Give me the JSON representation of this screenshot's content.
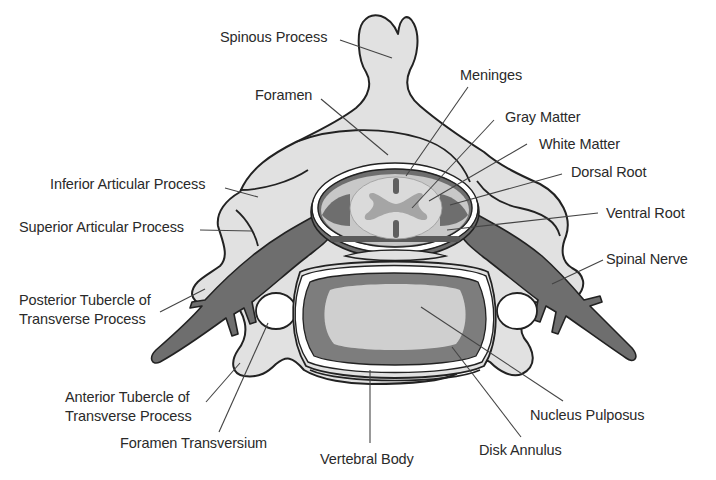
{
  "diagram": {
    "colors": {
      "background": "#ffffff",
      "bone": "#e1e1e1",
      "outline": "#222222",
      "nerve": "#6e6e6e",
      "annulus": "#7d7d7d",
      "nucleus": "#cfcfcf",
      "cord_white": "#dadada",
      "cord_gray": "#a5a5a5",
      "meninges": "#ffffff",
      "leader": "#444444"
    },
    "labels": [
      {
        "id": "spinous-process",
        "text": "Spinous Process",
        "x": 220,
        "y": 28
      },
      {
        "id": "foramen",
        "text": "Foramen",
        "x": 255,
        "y": 86
      },
      {
        "id": "meninges",
        "text": "Meninges",
        "x": 460,
        "y": 66
      },
      {
        "id": "gray-matter",
        "text": "Gray Matter",
        "x": 505,
        "y": 108
      },
      {
        "id": "white-matter",
        "text": "White Matter",
        "x": 539,
        "y": 135
      },
      {
        "id": "dorsal-root",
        "text": "Dorsal Root",
        "x": 571,
        "y": 163
      },
      {
        "id": "ventral-root",
        "text": "Ventral Root",
        "x": 606,
        "y": 204
      },
      {
        "id": "inferior-articular-process",
        "text": "Inferior Articular Process",
        "x": 50,
        "y": 175
      },
      {
        "id": "superior-articular-process",
        "text": "Superior Articular Process",
        "x": 19,
        "y": 218
      },
      {
        "id": "spinal-nerve",
        "text": "Spinal Nerve",
        "x": 606,
        "y": 250
      },
      {
        "id": "posterior-tubercle",
        "text": "Posterior Tubercle of",
        "text2": "Transverse Process",
        "x": 19,
        "y": 291
      },
      {
        "id": "anterior-tubercle",
        "text": "Anterior Tubercle of",
        "text2": "Transverse Process",
        "x": 65,
        "y": 388
      },
      {
        "id": "foramen-transversium",
        "text": "Foramen Transversium",
        "x": 120,
        "y": 434
      },
      {
        "id": "vertebral-body",
        "text": "Vertebral Body",
        "x": 320,
        "y": 450
      },
      {
        "id": "disk-annulus",
        "text": "Disk Annulus",
        "x": 479,
        "y": 441
      },
      {
        "id": "nucleus-pulposus",
        "text": "Nucleus Pulposus",
        "x": 530,
        "y": 406
      }
    ],
    "leaders": [
      {
        "for": "spinous-process",
        "x1": 340,
        "y1": 40,
        "x2": 392,
        "y2": 58
      },
      {
        "for": "foramen",
        "x1": 321,
        "y1": 99,
        "x2": 388,
        "y2": 155
      },
      {
        "for": "meninges",
        "x1": 468,
        "y1": 87,
        "x2": 406,
        "y2": 176
      },
      {
        "for": "gray-matter",
        "x1": 494,
        "y1": 120,
        "x2": 412,
        "y2": 208
      },
      {
        "for": "white-matter",
        "x1": 527,
        "y1": 144,
        "x2": 429,
        "y2": 201
      },
      {
        "for": "dorsal-root",
        "x1": 562,
        "y1": 174,
        "x2": 450,
        "y2": 205
      },
      {
        "for": "ventral-root",
        "x1": 598,
        "y1": 213,
        "x2": 447,
        "y2": 230
      },
      {
        "for": "inferior-articular-process",
        "x1": 225,
        "y1": 188,
        "x2": 258,
        "y2": 197
      },
      {
        "for": "superior-articular-process",
        "x1": 200,
        "y1": 230,
        "x2": 252,
        "y2": 231
      },
      {
        "for": "spinal-nerve",
        "x1": 603,
        "y1": 260,
        "x2": 552,
        "y2": 284
      },
      {
        "for": "posterior-tubercle",
        "x1": 160,
        "y1": 312,
        "x2": 205,
        "y2": 289
      },
      {
        "for": "anterior-tubercle",
        "x1": 206,
        "y1": 402,
        "x2": 240,
        "y2": 363
      },
      {
        "for": "foramen-transversium",
        "x1": 219,
        "y1": 432,
        "x2": 268,
        "y2": 323
      },
      {
        "for": "vertebral-body",
        "x1": 370,
        "y1": 443,
        "x2": 370,
        "y2": 370
      },
      {
        "for": "disk-annulus",
        "x1": 521,
        "y1": 437,
        "x2": 452,
        "y2": 347
      },
      {
        "for": "nucleus-pulposus",
        "x1": 563,
        "y1": 401,
        "x2": 421,
        "y2": 307
      }
    ]
  }
}
